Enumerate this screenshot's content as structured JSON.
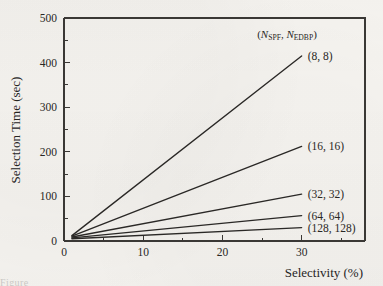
{
  "figure": {
    "background_color": "#f6f4f0",
    "ink_color": "#2a2826",
    "caption_fragment": "Figure"
  },
  "chart_data": {
    "type": "line",
    "title": "",
    "xlabel": "Selectivity (%)",
    "ylabel": "Selection Time (sec)",
    "xlim": [
      0,
      38
    ],
    "ylim": [
      0,
      500
    ],
    "grid": false,
    "legend_position": "right-of-line-ends",
    "legend_header": "(NSPF, NEDBP)",
    "legend_header_parts": {
      "open_paren": "(",
      "var1": "N",
      "sub1": "SPF",
      "separator": ", ",
      "var2": "N",
      "sub2": "EDBP",
      "close_paren": ")"
    },
    "xticks": [
      0,
      10,
      20,
      30
    ],
    "xtick_labels": [
      "0",
      "10",
      "20",
      "30"
    ],
    "xticks_minor": [
      5,
      15,
      25,
      35
    ],
    "yticks": [
      0,
      100,
      200,
      300,
      400,
      500
    ],
    "ytick_labels": [
      "0",
      "100",
      "200",
      "300",
      "400",
      "500"
    ],
    "yticks_minor": [
      50,
      150,
      250,
      350,
      450
    ],
    "x": [
      1,
      30
    ],
    "series": [
      {
        "name": "(8, 8)",
        "label": "(8, 8)",
        "values": [
          12,
          415
        ]
      },
      {
        "name": "(16, 16)",
        "label": "(16, 16)",
        "values": [
          11,
          212
        ]
      },
      {
        "name": "(32, 32)",
        "label": "(32, 32)",
        "values": [
          9,
          105
        ]
      },
      {
        "name": "(64, 64)",
        "label": "(64, 64)",
        "values": [
          7,
          57
        ]
      },
      {
        "name": "(128, 128)",
        "label": "(128, 128)",
        "values": [
          5,
          30
        ]
      }
    ]
  }
}
